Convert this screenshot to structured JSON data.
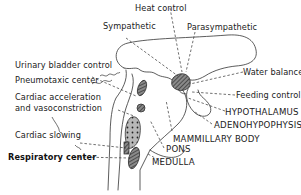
{
  "diagram": {
    "labels": {
      "heat_control": "Heat control",
      "sympathetic": "Sympathetic",
      "parasympathetic": "Parasympathetic",
      "urinary_bladder_control": "Urinary bladder control",
      "water_balance": "Water balance",
      "pneumotaxic_center": "Pneumotaxic center",
      "feeding_control": "Feeding control",
      "cardiac_acceleration_line1": "Cardiac acceleration",
      "cardiac_acceleration_line2": "and vasoconstriction",
      "hypothalamus": "HYPOTHALAMUS",
      "adenohypophysis": "ADENOHYPOPHYSIS",
      "mammillary_body": "MAMMILLARY BODY",
      "cardiac_slowing": "Cardiac slowing",
      "pons": "PONS",
      "respiratory_center": "Respiratory center",
      "medulla": "MEDULLA"
    },
    "colors": {
      "ink": "#222222",
      "background": "#ffffff",
      "fill_dark": "#555555"
    }
  }
}
